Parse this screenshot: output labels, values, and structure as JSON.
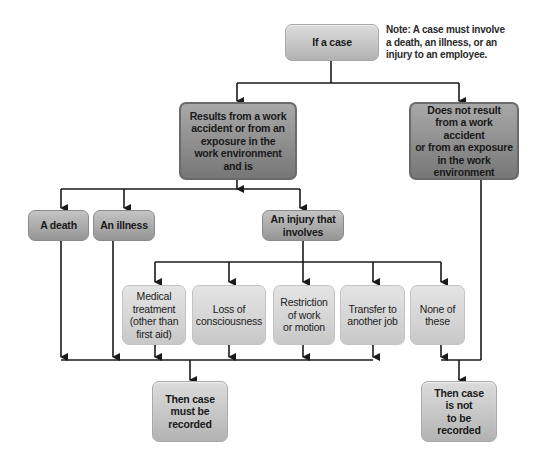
{
  "diagram": {
    "note": "Note: A case must involve\na death, an illness, or an\ninjury to an employee.",
    "nodes": {
      "start": "If a case",
      "work_related": "Results from a work\naccident or from an\nexposure in the\nwork environment\nand is",
      "not_work_related": "Does not result\nfrom a work accident\nor from an exposure\nin the work\nenvironment",
      "death": "A death",
      "illness": "An illness",
      "injury": "An injury that\ninvolves",
      "medical_treatment": "Medical\ntreatment\n(other than\nfirst aid)",
      "loss_of_consciousness": "Loss of\nconsciousness",
      "restriction": "Restriction\nof work\nor motion",
      "transfer": "Transfer to\nanother job",
      "none": "None of\nthese",
      "recorded": "Then case\nmust be\nrecorded",
      "not_recorded": "Then case\nis not\nto be\nrecorded"
    },
    "colors": {
      "connector": "#1a1a1a",
      "box_light": "#c6c6c6",
      "box_dark": "#8e8e8e",
      "box_pale": "#d4d4d4"
    }
  }
}
